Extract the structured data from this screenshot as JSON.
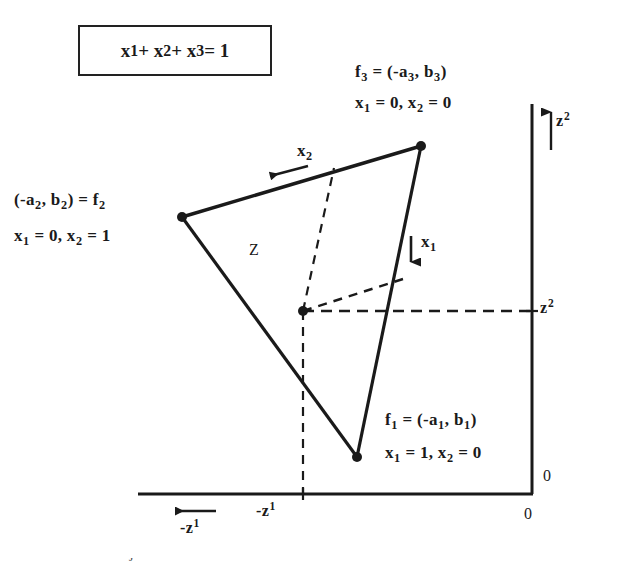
{
  "figure": {
    "background": "#ffffff",
    "ink_color": "#1a1a1a",
    "width": 629,
    "height": 576
  },
  "constraint_box": {
    "equation_html": "x<sub>1</sub> + x<sub>2</sub> + x<sub>3</sub> = 1",
    "equation_text": "x1 + x2 + x3 = 1"
  },
  "vertices": {
    "f3": {
      "label_html": "f<sub>3</sub> = (-a<sub>3</sub>, b<sub>3</sub>)",
      "conditions_html": "x<sub>1</sub> = 0,  x<sub>2</sub> = 0",
      "label_text": "f3 = (-a3, b3)",
      "conditions_text": "x1 = 0, x2 = 0",
      "x": 421,
      "y": 146
    },
    "f2": {
      "label_html": "(-a<sub>2</sub>, b<sub>2</sub>) = f<sub>2</sub>",
      "conditions_html": "x<sub>1</sub> = 0,  x<sub>2</sub> = 1",
      "label_text": "(-a2, b2) = f2",
      "conditions_text": "x1 = 0, x2 = 1",
      "x": 182,
      "y": 217
    },
    "f1": {
      "label_html": "f<sub>1</sub> = (-a<sub>1</sub>, b<sub>1</sub>)",
      "conditions_html": "x<sub>1</sub> = 1,  x<sub>2</sub> = 0",
      "label_text": "f1 = (-a1, b1)",
      "conditions_text": "x1 = 1, x2 = 0",
      "x": 357,
      "y": 457
    }
  },
  "interior_point": {
    "x": 303,
    "y": 311,
    "name": "z"
  },
  "region": {
    "label": "Z"
  },
  "direction_arrows": {
    "x2": {
      "label_html": "x<sub>2</sub>",
      "label_text": "x2",
      "direction": "left"
    },
    "x1": {
      "label_html": "x<sub>1</sub>",
      "label_text": "x1",
      "direction": "down"
    }
  },
  "axes": {
    "vertical": {
      "axis_label_html": "z<sup>2</sup>",
      "axis_label_text": "z2",
      "value_label_html": "z<sup>2</sup>",
      "value_label_text": "z2",
      "origin_label": "0",
      "x": 532,
      "top": 104,
      "bottom": 494
    },
    "horizontal": {
      "axis_label_html": "-z<sup>1</sup>",
      "axis_label_text": "-z1",
      "value_label_html": "-z<sup>1</sup>",
      "value_label_text": "-z1",
      "origin_label": "0",
      "y": 494,
      "left": 138,
      "right": 532
    }
  },
  "caption": {
    "text": "t d bl ti i t d bj ti f ti"
  },
  "chart_data": {
    "type": "scatter",
    "title": "",
    "xlabel": "-z1",
    "ylabel": "z2",
    "grid": false,
    "legend": "none",
    "polygon": {
      "name": "Z",
      "points_px": [
        [
          182,
          217
        ],
        [
          421,
          146
        ],
        [
          357,
          457
        ]
      ],
      "vertex_names": [
        "f2",
        "f3",
        "f1"
      ]
    },
    "annotations": [
      {
        "text": "f3 = (-a3, b3); x1 = 0, x2 = 0",
        "at_px": [
          421,
          146
        ]
      },
      {
        "text": "(-a2, b2) = f2; x1 = 0, x2 = 1",
        "at_px": [
          182,
          217
        ]
      },
      {
        "text": "f1 = (-a1, b1); x1 = 1, x2 = 0",
        "at_px": [
          357,
          457
        ]
      },
      {
        "text": "x1 + x2 + x3 = 1",
        "at_px": [
          175,
          50
        ]
      },
      {
        "text": "Z",
        "at_px": [
          253,
          249
        ]
      },
      {
        "text": "z",
        "at_px": [
          303,
          311
        ]
      }
    ]
  }
}
